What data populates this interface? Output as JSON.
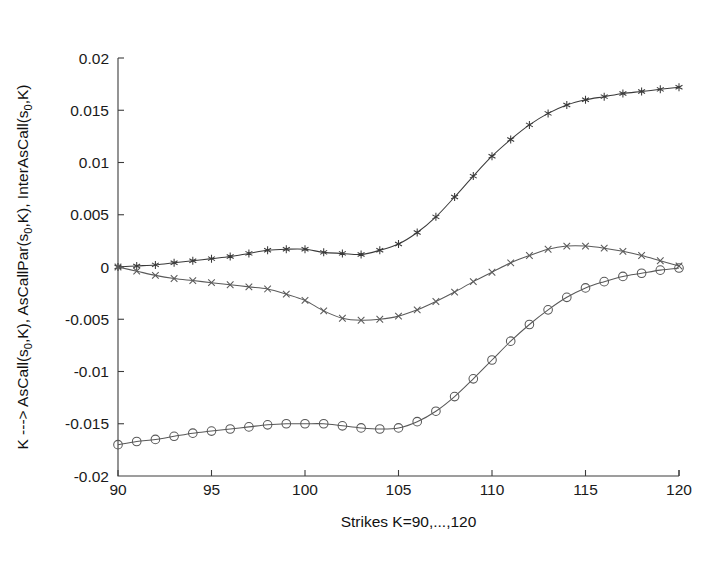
{
  "figure": {
    "background_color": "#ffffff",
    "axis_color": "#3c3c3c",
    "text_color": "#1a1a1a"
  },
  "axes": {
    "x_title": "Strikes K=90,...,120",
    "y_title_parts": {
      "p1": "K ---> AsCall(s",
      "sub1": "0",
      "p2": ",K), AsCallPar(s",
      "sub2": "0",
      "p3": ",K), InterAsCall(s",
      "sub3": "0",
      "p4": ",K)"
    },
    "y_title_plain": "K ---> AsCall(s0,K), AsCallPar(s0,K), InterAsCall(s0,K)",
    "x_ticks": [
      "90",
      "95",
      "100",
      "105",
      "110",
      "115",
      "120"
    ],
    "y_ticks": [
      "0.02",
      "0.015",
      "0.01",
      "0.005",
      "0",
      "-0.005",
      "-0.01",
      "-0.015",
      "-0.02"
    ]
  },
  "chart_data": {
    "type": "line",
    "title": "",
    "xlabel": "Strikes K=90,...,120",
    "ylabel": "K ---> AsCall(s0,K), AsCallPar(s0,K), InterAsCall(s0,K)",
    "xlim": [
      90,
      120
    ],
    "ylim": [
      -0.02,
      0.02
    ],
    "xticks": [
      90,
      95,
      100,
      105,
      110,
      115,
      120
    ],
    "yticks": [
      0.02,
      0.015,
      0.01,
      0.005,
      0,
      -0.005,
      -0.01,
      -0.015,
      -0.02
    ],
    "grid": false,
    "legend": "none",
    "x": [
      90,
      91,
      92,
      93,
      94,
      95,
      96,
      97,
      98,
      99,
      100,
      101,
      102,
      103,
      104,
      105,
      106,
      107,
      108,
      109,
      110,
      111,
      112,
      113,
      114,
      115,
      116,
      117,
      118,
      119,
      120
    ],
    "series": [
      {
        "name": "AsCall(s0,K)",
        "marker": "asterisk",
        "color": "#3a3a3a",
        "values": [
          0.0,
          0.0001,
          0.0002,
          0.0004,
          0.0006,
          0.0008,
          0.001,
          0.0013,
          0.0016,
          0.0017,
          0.0017,
          0.0014,
          0.0013,
          0.0012,
          0.0016,
          0.0022,
          0.0033,
          0.0048,
          0.0067,
          0.0087,
          0.0106,
          0.0122,
          0.0136,
          0.0147,
          0.0155,
          0.016,
          0.0163,
          0.0166,
          0.0168,
          0.017,
          0.0172
        ]
      },
      {
        "name": "AsCallPar(s0,K)",
        "marker": "x",
        "color": "#5a5a5a",
        "values": [
          0.0,
          -0.0004,
          -0.0008,
          -0.0011,
          -0.0013,
          -0.0015,
          -0.0017,
          -0.0019,
          -0.0021,
          -0.0026,
          -0.0032,
          -0.0042,
          -0.0049,
          -0.0051,
          -0.005,
          -0.0047,
          -0.0041,
          -0.0033,
          -0.0024,
          -0.0014,
          -0.0005,
          0.0004,
          0.0011,
          0.0017,
          0.002,
          0.002,
          0.0018,
          0.0015,
          0.0011,
          0.0006,
          0.0001
        ]
      },
      {
        "name": "InterAsCall(s0,K)",
        "marker": "circle",
        "color": "#585858",
        "values": [
          -0.017,
          -0.0167,
          -0.0165,
          -0.0162,
          -0.0159,
          -0.0157,
          -0.0155,
          -0.0153,
          -0.0151,
          -0.015,
          -0.015,
          -0.015,
          -0.0152,
          -0.0154,
          -0.0155,
          -0.0154,
          -0.0148,
          -0.0138,
          -0.0124,
          -0.0107,
          -0.0089,
          -0.0071,
          -0.0055,
          -0.0041,
          -0.0029,
          -0.002,
          -0.0014,
          -0.0009,
          -0.0006,
          -0.0003,
          -0.0001
        ]
      }
    ]
  }
}
